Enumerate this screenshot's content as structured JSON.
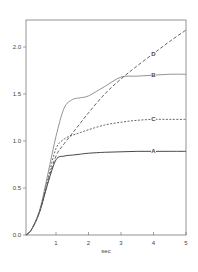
{
  "chart_data": {
    "type": "line",
    "title": "",
    "xlabel": "sec",
    "ylabel": "",
    "xlim": [
      0,
      5
    ],
    "ylim": [
      0,
      2.3
    ],
    "grid": false,
    "legend": "inline markers at t=4",
    "x_ticks": [
      "1",
      "2",
      "3",
      "4",
      "5"
    ],
    "y_ticks": [
      "0.0",
      "0.5",
      "1.0",
      "1.5",
      "2.0"
    ],
    "x": [
      0,
      0.25,
      0.5,
      0.75,
      1.0,
      1.25,
      1.5,
      1.75,
      2.0,
      2.5,
      3.0,
      3.5,
      4.0,
      4.5,
      5.0
    ],
    "series": [
      {
        "name": "A",
        "style": "solid",
        "color": "#333333",
        "values": [
          0,
          0.06,
          0.25,
          0.55,
          0.8,
          0.84,
          0.85,
          0.86,
          0.87,
          0.88,
          0.885,
          0.89,
          0.89,
          0.89,
          0.89
        ]
      },
      {
        "name": "B",
        "style": "solid",
        "color": "#888888",
        "values": [
          0,
          0.06,
          0.27,
          0.65,
          1.05,
          1.35,
          1.44,
          1.46,
          1.48,
          1.58,
          1.68,
          1.69,
          1.7,
          1.71,
          1.71
        ]
      },
      {
        "name": "C",
        "style": "dashed",
        "color": "#555555",
        "values": [
          0,
          0.06,
          0.26,
          0.6,
          0.92,
          1.02,
          1.06,
          1.09,
          1.12,
          1.17,
          1.2,
          1.22,
          1.23,
          1.23,
          1.23
        ]
      },
      {
        "name": "D",
        "style": "long-dashed",
        "color": "#555555",
        "values": [
          0,
          0.06,
          0.25,
          0.57,
          0.84,
          0.97,
          1.08,
          1.19,
          1.3,
          1.5,
          1.66,
          1.8,
          1.93,
          2.06,
          2.18
        ]
      }
    ]
  },
  "axis": {
    "x_label": "sec"
  },
  "markers": {
    "A": "A",
    "B": "B",
    "C": "C",
    "D": "D"
  }
}
